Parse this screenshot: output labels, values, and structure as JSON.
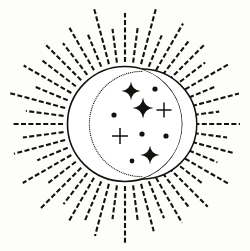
{
  "artwork": {
    "title": "Celestial Sun and Crescent Moon Emblem",
    "style": "line-art-engraving",
    "canvas": {
      "width": 250,
      "height": 251
    },
    "background_color": "#fdfdfc",
    "ink_color": "#14120f"
  },
  "disc": {
    "label": "Sun disc",
    "center_x": 125,
    "center_y": 124,
    "radius": 57.5,
    "stroke_width": 1.6,
    "fill": "#ffffff"
  },
  "crescent": {
    "label": "Crescent moon overlay",
    "outer_arc": {
      "center_x": 125,
      "center_y": 124,
      "radius": 57.5
    },
    "inner_arc": {
      "center_x": 142,
      "center_y": 124,
      "radius": 55
    },
    "stroke_width": 1.5,
    "stipple_dot_count": 86,
    "stipple_dot_radius": 0.62
  },
  "rays": {
    "label": "Radiating dashed sun rays",
    "count": 48,
    "inner_radius": 62,
    "outer_radius_long": 116,
    "outer_radius_short": 100,
    "stroke_width": 2.1,
    "dash_pattern": "5 2.4",
    "alternating": true
  },
  "sparkles": [
    {
      "name": "sparkle-1",
      "x": 131,
      "y": 91,
      "radius": 9.5,
      "waist": 1.9,
      "type": "four-point-star"
    },
    {
      "name": "sparkle-2",
      "x": 143,
      "y": 108,
      "radius": 10.5,
      "waist": 2.1,
      "type": "four-point-star"
    },
    {
      "name": "sparkle-3",
      "x": 150,
      "y": 155,
      "radius": 9.5,
      "waist": 1.9,
      "type": "four-point-star"
    }
  ],
  "crosses": [
    {
      "name": "cross-1",
      "x": 164,
      "y": 110,
      "radius": 7.5,
      "thickness": 1.5,
      "type": "plus-cross"
    },
    {
      "name": "cross-2",
      "x": 120,
      "y": 136,
      "radius": 8.0,
      "thickness": 1.5,
      "type": "plus-cross"
    }
  ],
  "dots": [
    {
      "name": "dot-1",
      "x": 155,
      "y": 89,
      "radius": 2.6
    },
    {
      "name": "dot-2",
      "x": 114,
      "y": 115,
      "radius": 2.6
    },
    {
      "name": "dot-3",
      "x": 142,
      "y": 134,
      "radius": 2.6
    },
    {
      "name": "dot-4",
      "x": 166,
      "y": 136,
      "radius": 2.6
    },
    {
      "name": "dot-5",
      "x": 132,
      "y": 161,
      "radius": 2.4
    }
  ]
}
